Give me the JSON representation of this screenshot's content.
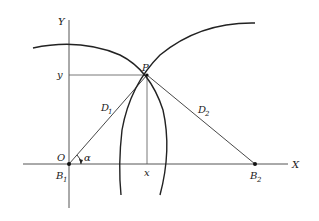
{
  "diagram": {
    "type": "geometry-trilateration",
    "axes": {
      "x_label": "X",
      "y_label": "Y"
    },
    "points": {
      "origin": {
        "label": "O",
        "alt_label": "B",
        "alt_sub": "1"
      },
      "target": {
        "label": "P"
      },
      "beacon2": {
        "label": "B",
        "sub": "2"
      }
    },
    "distances": [
      {
        "label": "D",
        "sub": "1",
        "from": "B1",
        "to": "P"
      },
      {
        "label": "D",
        "sub": "2",
        "from": "B2",
        "to": "P"
      }
    ],
    "projections": {
      "x_label": "x",
      "y_label": "y"
    },
    "angle": {
      "label": "α"
    },
    "colors": {
      "line": "#222222",
      "axis": "#555555",
      "background": "#ffffff"
    }
  }
}
